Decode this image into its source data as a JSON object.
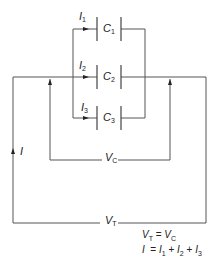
{
  "diagram": {
    "type": "parallel-capacitor-circuit",
    "capacitors": [
      {
        "label": "C",
        "sub": "1",
        "current": "I",
        "current_sub": "1"
      },
      {
        "label": "C",
        "sub": "2",
        "current": "I",
        "current_sub": "2"
      },
      {
        "label": "C",
        "sub": "3",
        "current": "I",
        "current_sub": "3"
      }
    ],
    "total_current": {
      "label": "I"
    },
    "voltages": {
      "capacitor": {
        "label": "V",
        "sub": "C"
      },
      "total": {
        "label": "V",
        "sub": "T"
      }
    },
    "equations": [
      "V_T = V_C",
      "I = I_1 + I_2 + I_3"
    ],
    "equation_lines": {
      "line1_lhs": "V",
      "line1_lhs_sub": "T",
      "line1_eq": " = ",
      "line1_rhs": "V",
      "line1_rhs_sub": "C",
      "line2_lhs": "I",
      "line2_eq": "  = ",
      "t1": "I",
      "t1_sub": "1",
      "plus1": " + ",
      "t2": "I",
      "t2_sub": "2",
      "plus2": " + ",
      "t3": "I",
      "t3_sub": "3"
    },
    "colors": {
      "line": "#555555",
      "text": "#222222",
      "background": "#ffffff"
    }
  }
}
